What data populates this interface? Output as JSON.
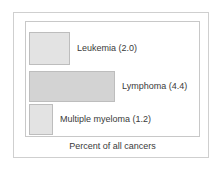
{
  "chart_data": {
    "type": "bar",
    "orientation": "horizontal",
    "title": "",
    "xlabel": "Percent of all cancers",
    "ylabel": "",
    "categories": [
      "Leukemia",
      "Lymphoma",
      "Multiple myeloma"
    ],
    "values": [
      2.0,
      4.4,
      1.2
    ],
    "data_labels": [
      "Leukemia (2.0)",
      "Lymphoma (4.4)",
      "Multiple myeloma (1.2)"
    ],
    "xlim": [
      0,
      9
    ],
    "grid": false,
    "legend": null,
    "bar_colors": [
      "#e3e3e3",
      "#d3d3d3",
      "#e3e3e3"
    ],
    "bar_border_color": "#bdbdbd"
  },
  "figure": {
    "caption": "Percent of all cancers",
    "frame_color": "#cfcfcf",
    "plot_border_color": "#c8c8c8",
    "background": "#ffffff"
  },
  "bars": [
    {
      "label": "Leukemia (2.0)",
      "value": 2.0,
      "width_px": "41px",
      "fill": "#e3e3e3"
    },
    {
      "label": "Lymphoma (4.4)",
      "value": 4.4,
      "width_px": "86px",
      "fill": "#d3d3d3"
    },
    {
      "label": "Multiple myeloma (1.2)",
      "value": 1.2,
      "width_px": "24px",
      "fill": "#e3e3e3"
    }
  ]
}
